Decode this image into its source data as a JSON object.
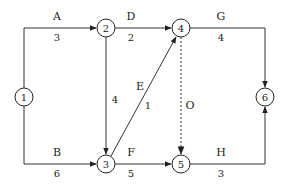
{
  "diagram": {
    "type": "activity-on-arrow network",
    "nodes": [
      {
        "id": "1",
        "label": "1",
        "x": 24,
        "y": 97
      },
      {
        "id": "2",
        "label": "2",
        "x": 106,
        "y": 28
      },
      {
        "id": "3",
        "label": "3",
        "x": 106,
        "y": 164
      },
      {
        "id": "4",
        "label": "4",
        "x": 181,
        "y": 28
      },
      {
        "id": "5",
        "label": "5",
        "x": 181,
        "y": 164
      },
      {
        "id": "6",
        "label": "6",
        "x": 265,
        "y": 97
      }
    ],
    "activities": [
      {
        "name": "A",
        "duration": "3",
        "from": "1",
        "to": "2",
        "dashed": false
      },
      {
        "name": "B",
        "duration": "6",
        "from": "1",
        "to": "3",
        "dashed": false
      },
      {
        "name": "C",
        "duration": "4",
        "from": "2",
        "to": "3",
        "dashed": false,
        "name_shown": false
      },
      {
        "name": "D",
        "duration": "2",
        "from": "2",
        "to": "4",
        "dashed": false
      },
      {
        "name": "E",
        "duration": "1",
        "from": "3",
        "to": "4",
        "dashed": false
      },
      {
        "name": "F",
        "duration": "5",
        "from": "3",
        "to": "5",
        "dashed": false
      },
      {
        "name": "O",
        "duration": "",
        "from": "4",
        "to": "5",
        "dashed": true
      },
      {
        "name": "G",
        "duration": "4",
        "from": "4",
        "to": "6",
        "dashed": false
      },
      {
        "name": "H",
        "duration": "3",
        "from": "5",
        "to": "6",
        "dashed": false
      }
    ],
    "labels": {
      "A": "A",
      "A_dur": "3",
      "B": "B",
      "B_dur": "6",
      "C_dur": "4",
      "D": "D",
      "D_dur": "2",
      "E": "E",
      "E_dur": "1",
      "F": "F",
      "F_dur": "5",
      "O": "O",
      "G": "G",
      "G_dur": "4",
      "H": "H",
      "H_dur": "3"
    },
    "colors": {
      "line": "#333333",
      "dummy_line": "#555555",
      "text": "#222222",
      "background": "#ffffff"
    }
  }
}
